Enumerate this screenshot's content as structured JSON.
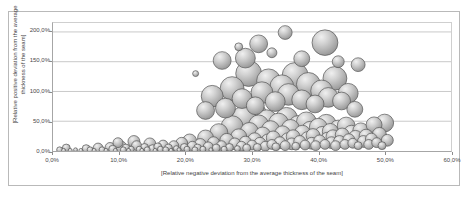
{
  "chart_data": {
    "type": "scatter",
    "title": "",
    "xlabel": "[Relative negative deviation from the average thickness  of the seam]",
    "ylabel_line1": "[Relative positive deviation from the average",
    "ylabel_line2": "thickness  of the seam]",
    "xlim": [
      0,
      60
    ],
    "ylim": [
      0,
      215
    ],
    "xticks": [
      "0,0%",
      "10,0%",
      "20,0%",
      "30,0%",
      "40,0%",
      "50,0%",
      "60,0%"
    ],
    "xtick_values": [
      0,
      10,
      20,
      30,
      40,
      50,
      60
    ],
    "yticks": [
      "0,0%",
      "50,0%",
      "100,0%",
      "150,0%",
      "200,0%"
    ],
    "ytick_values": [
      0,
      50,
      100,
      150,
      200
    ],
    "grid": "horizontal",
    "legend": "none",
    "series": [
      {
        "name": "Seam thickness deviation",
        "marker": "bubble-3d-gray",
        "fill_color": "#b3b3b3",
        "edge_color": "#555555",
        "points": [
          [
            1.0,
            2,
            3
          ],
          [
            1.6,
            1,
            2
          ],
          [
            2.0,
            5,
            4
          ],
          [
            2.6,
            1,
            2
          ],
          [
            3.4,
            2,
            2
          ],
          [
            4.2,
            1,
            2
          ],
          [
            5.0,
            4,
            4
          ],
          [
            5.6,
            2,
            3
          ],
          [
            6.2,
            1,
            2
          ],
          [
            6.8,
            5,
            5
          ],
          [
            7.4,
            2,
            3
          ],
          [
            8.0,
            1,
            2
          ],
          [
            8.6,
            6,
            5
          ],
          [
            9.0,
            3,
            4
          ],
          [
            9.4,
            1,
            2
          ],
          [
            9.8,
            14,
            5
          ],
          [
            10.2,
            7,
            6
          ],
          [
            10.6,
            2,
            3
          ],
          [
            11.0,
            5,
            4
          ],
          [
            11.4,
            1,
            2
          ],
          [
            11.8,
            3,
            3
          ],
          [
            12.2,
            16,
            6
          ],
          [
            12.6,
            9,
            5
          ],
          [
            13.0,
            3,
            3
          ],
          [
            13.4,
            1,
            2
          ],
          [
            13.8,
            6,
            4
          ],
          [
            14.2,
            2,
            3
          ],
          [
            14.6,
            12,
            6
          ],
          [
            15.0,
            4,
            4
          ],
          [
            15.4,
            1,
            2
          ],
          [
            15.8,
            7,
            4
          ],
          [
            16.2,
            3,
            3
          ],
          [
            16.6,
            10,
            5
          ],
          [
            17.0,
            2,
            3
          ],
          [
            17.4,
            5,
            4
          ],
          [
            17.8,
            1,
            2
          ],
          [
            18.2,
            9,
            5
          ],
          [
            18.6,
            4,
            3
          ],
          [
            19.0,
            2,
            2
          ],
          [
            19.4,
            13,
            6
          ],
          [
            19.8,
            6,
            4
          ],
          [
            20.2,
            3,
            3
          ],
          [
            20.6,
            17,
            7
          ],
          [
            21.0,
            8,
            5
          ],
          [
            21.4,
            2,
            3
          ],
          [
            21.8,
            5,
            4
          ],
          [
            22.2,
            11,
            6
          ],
          [
            22.6,
            3,
            3
          ],
          [
            23.0,
            22,
            8
          ],
          [
            23.4,
            7,
            5
          ],
          [
            23.8,
            2,
            2
          ],
          [
            24.2,
            14,
            6
          ],
          [
            24.6,
            5,
            4
          ],
          [
            25.0,
            31,
            9
          ],
          [
            25.4,
            9,
            5
          ],
          [
            25.8,
            3,
            3
          ],
          [
            26.2,
            18,
            7
          ],
          [
            26.6,
            6,
            4
          ],
          [
            27.0,
            41,
            11
          ],
          [
            27.4,
            12,
            6
          ],
          [
            27.8,
            4,
            3
          ],
          [
            28.0,
            24,
            8
          ],
          [
            28.4,
            8,
            5
          ],
          [
            28.8,
            56,
            12
          ],
          [
            29.0,
            15,
            6
          ],
          [
            29.2,
            5,
            4
          ],
          [
            29.6,
            33,
            9
          ],
          [
            30.0,
            10,
            5
          ],
          [
            30.2,
            62,
            13
          ],
          [
            30.4,
            19,
            7
          ],
          [
            30.8,
            6,
            4
          ],
          [
            31.0,
            44,
            10
          ],
          [
            31.2,
            13,
            6
          ],
          [
            31.6,
            27,
            8
          ],
          [
            32.0,
            8,
            5
          ],
          [
            32.2,
            51,
            11
          ],
          [
            32.4,
            17,
            7
          ],
          [
            32.8,
            36,
            9
          ],
          [
            33.0,
            11,
            5
          ],
          [
            33.2,
            22,
            7
          ],
          [
            33.6,
            7,
            4
          ],
          [
            34.0,
            47,
            10
          ],
          [
            34.2,
            14,
            6
          ],
          [
            34.6,
            29,
            8
          ],
          [
            35.0,
            9,
            5
          ],
          [
            35.2,
            55,
            11
          ],
          [
            35.4,
            19,
            7
          ],
          [
            35.8,
            38,
            9
          ],
          [
            36.0,
            12,
            6
          ],
          [
            36.2,
            24,
            7
          ],
          [
            36.6,
            8,
            4
          ],
          [
            37.0,
            43,
            10
          ],
          [
            37.2,
            16,
            6
          ],
          [
            37.6,
            30,
            8
          ],
          [
            38.0,
            10,
            5
          ],
          [
            38.2,
            49,
            10
          ],
          [
            38.4,
            21,
            7
          ],
          [
            38.8,
            35,
            9
          ],
          [
            39.0,
            13,
            6
          ],
          [
            39.2,
            26,
            7
          ],
          [
            39.6,
            9,
            5
          ],
          [
            40.0,
            40,
            9
          ],
          [
            40.2,
            17,
            6
          ],
          [
            40.6,
            28,
            8
          ],
          [
            41.0,
            11,
            5
          ],
          [
            41.2,
            45,
            10
          ],
          [
            41.4,
            20,
            7
          ],
          [
            41.8,
            33,
            8
          ],
          [
            42.0,
            14,
            6
          ],
          [
            42.2,
            24,
            7
          ],
          [
            42.6,
            9,
            5
          ],
          [
            43.0,
            37,
            9
          ],
          [
            43.2,
            16,
            6
          ],
          [
            43.6,
            27,
            7
          ],
          [
            44.0,
            11,
            5
          ],
          [
            44.2,
            42,
            9
          ],
          [
            44.6,
            19,
            6
          ],
          [
            45.0,
            30,
            8
          ],
          [
            45.2,
            13,
            5
          ],
          [
            45.6,
            23,
            7
          ],
          [
            46.0,
            9,
            4
          ],
          [
            46.4,
            34,
            8
          ],
          [
            46.8,
            16,
            6
          ],
          [
            47.2,
            25,
            7
          ],
          [
            47.6,
            11,
            5
          ],
          [
            48.0,
            20,
            6
          ],
          [
            48.4,
            44,
            8
          ],
          [
            48.8,
            14,
            5
          ],
          [
            49.2,
            28,
            7
          ],
          [
            49.6,
            9,
            4
          ],
          [
            50.0,
            47,
            9
          ],
          [
            50.4,
            18,
            6
          ],
          [
            23.0,
            68,
            9
          ],
          [
            24.0,
            92,
            11
          ],
          [
            26.0,
            72,
            10
          ],
          [
            27.0,
            105,
            12
          ],
          [
            28.5,
            88,
            10
          ],
          [
            29.5,
            130,
            13
          ],
          [
            30.5,
            76,
            9
          ],
          [
            31.5,
            98,
            11
          ],
          [
            32.5,
            118,
            12
          ],
          [
            33.5,
            83,
            10
          ],
          [
            34.5,
            108,
            12
          ],
          [
            35.5,
            95,
            11
          ],
          [
            36.5,
            127,
            13
          ],
          [
            37.5,
            86,
            10
          ],
          [
            38.5,
            112,
            12
          ],
          [
            39.5,
            79,
            9
          ],
          [
            40.5,
            101,
            11
          ],
          [
            41.5,
            90,
            10
          ],
          [
            42.5,
            122,
            12
          ],
          [
            43.5,
            84,
            9
          ],
          [
            44.5,
            97,
            10
          ],
          [
            45.5,
            70,
            8
          ],
          [
            21.5,
            130,
            3
          ],
          [
            25.5,
            152,
            9
          ],
          [
            29.0,
            156,
            10
          ],
          [
            31.0,
            180,
            9
          ],
          [
            35.0,
            199,
            7
          ],
          [
            37.5,
            155,
            8
          ],
          [
            41.0,
            182,
            13
          ],
          [
            43.0,
            150,
            6
          ],
          [
            46.0,
            145,
            7
          ],
          [
            33.0,
            165,
            5
          ],
          [
            28.0,
            175,
            4
          ]
        ]
      }
    ]
  }
}
